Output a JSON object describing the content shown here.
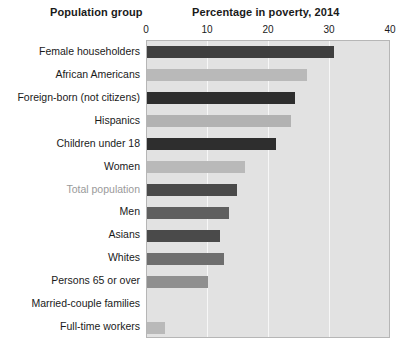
{
  "header": {
    "left_title": "Population group",
    "right_title": "Percentage in poverty, 2014"
  },
  "axis": {
    "ticks": [
      0,
      10,
      20,
      30,
      40
    ],
    "tick_labels": [
      "0",
      "10",
      "20",
      "30",
      "40"
    ],
    "gridlines": [
      10,
      20,
      30
    ]
  },
  "colors": {
    "plot_background": "#e2e2e2",
    "gridline": "#f7f7f7",
    "plot_border": "#b6b6b6",
    "bar_dark": "#3f3f3f",
    "bar_mid": "#6e6e6e",
    "bar_light": "#b9b9b9",
    "label_text": "#1a1a1a",
    "label_muted": "#9a9a9a"
  },
  "chart_data": {
    "type": "bar",
    "orientation": "horizontal",
    "title": "Percentage in poverty, 2014",
    "xlabel": "Percentage in poverty, 2014",
    "ylabel": "Population group",
    "xlim": [
      0,
      40
    ],
    "grid": true,
    "legend": "none",
    "categories": [
      "Female householders",
      "African Americans",
      "Foreign-born (not citizens)",
      "Hispanics",
      "Children under 18",
      "Women",
      "Total population",
      "Men",
      "Asians",
      "Whites",
      "Persons 65 or over",
      "Married-couple families",
      "Full-time workers"
    ],
    "values": [
      30.6,
      26.2,
      24.2,
      23.6,
      21.1,
      16.1,
      14.8,
      13.4,
      12.0,
      12.7,
      10.0,
      0.0,
      3.0
    ],
    "bar_colors": [
      "#3f3f3f",
      "#b9b9b9",
      "#2e2e2e",
      "#b2b2b2",
      "#2e2e2e",
      "#b9b9b9",
      "#4a4a4a",
      "#5f5f5f",
      "#4a4a4a",
      "#6e6e6e",
      "#8f8f8f",
      "#c9c9c9",
      "#b9b9b9"
    ],
    "highlighted_category": "Total population"
  }
}
